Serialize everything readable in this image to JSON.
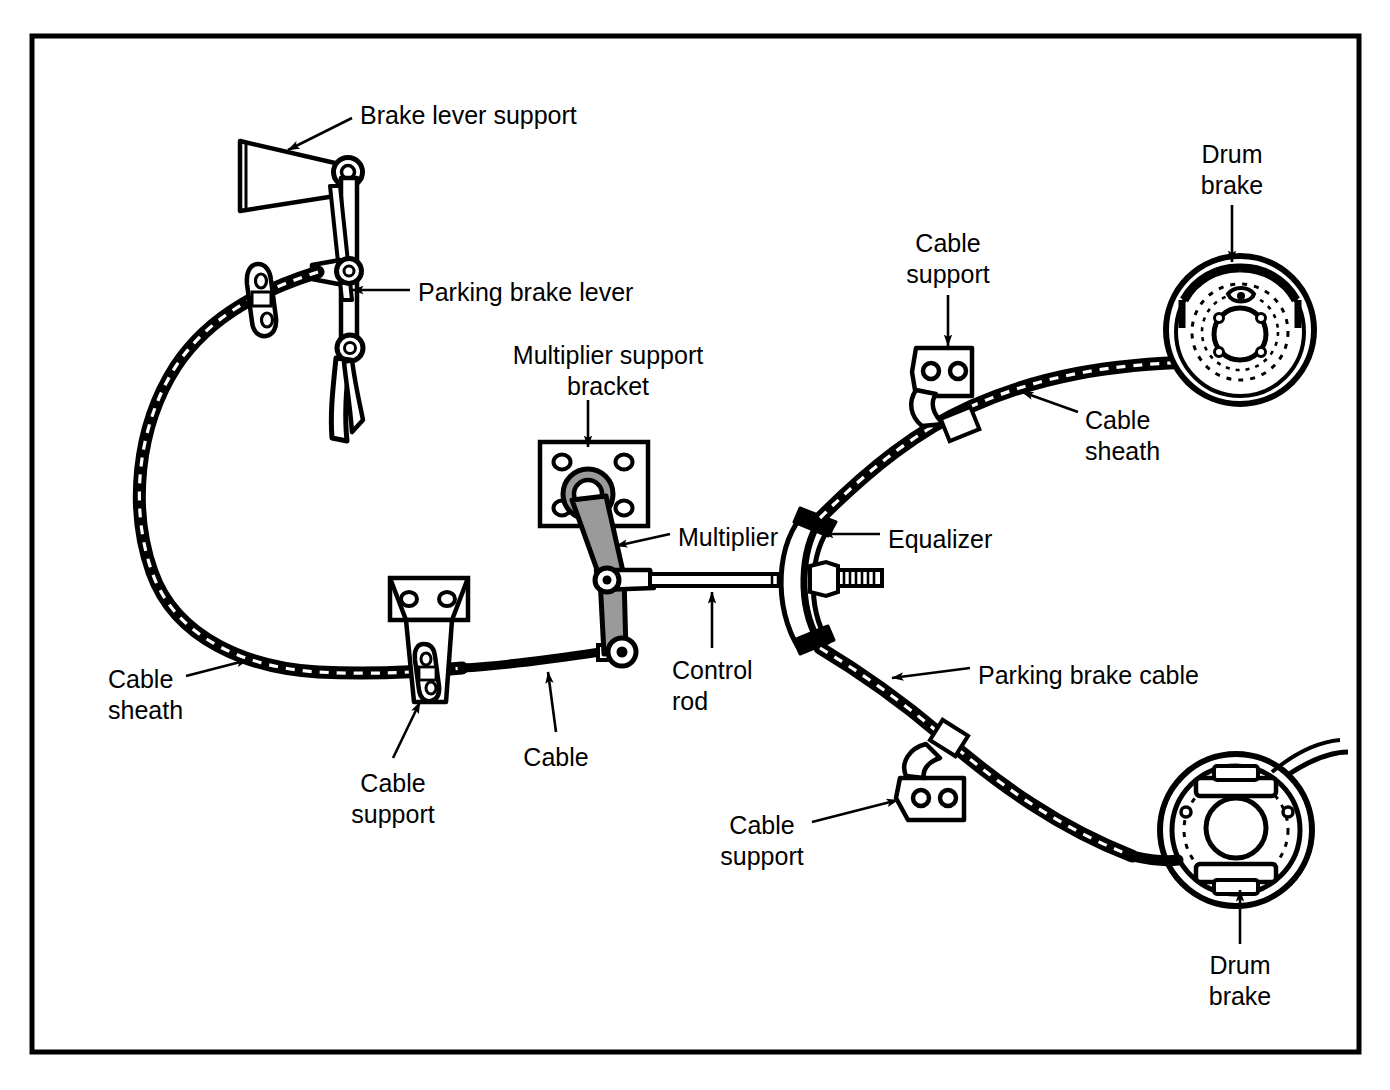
{
  "figure": {
    "type": "technical-line-illustration",
    "frame": {
      "x": 30,
      "y": 34,
      "width": 1330,
      "height": 1019,
      "stroke": "#000000",
      "stroke_width": 5
    },
    "background": "#ffffff",
    "line_color": "#000000",
    "fill_gray": "#9a9a9a"
  },
  "labels": [
    {
      "id": "brake-lever-support",
      "text": "Brake lever support",
      "x": 360,
      "y": 100,
      "align": "l",
      "leader": {
        "from": [
          352,
          118
        ],
        "to": [
          288,
          150
        ],
        "arrow": true
      }
    },
    {
      "id": "parking-brake-lever",
      "text": "Parking brake lever",
      "x": 418,
      "y": 277,
      "align": "l",
      "leader": {
        "from": [
          410,
          290
        ],
        "to": [
          352,
          290
        ],
        "arrow": true
      }
    },
    {
      "id": "drum-brake-upper",
      "text": "Drum\nbrake",
      "x": 1232,
      "y": 139,
      "align": "c",
      "leader": {
        "from": [
          1232,
          205
        ],
        "to": [
          1232,
          262
        ],
        "arrow": true
      }
    },
    {
      "id": "cable-support-upper-right",
      "text": "Cable\nsupport",
      "x": 948,
      "y": 228,
      "align": "c",
      "leader": {
        "from": [
          948,
          295
        ],
        "to": [
          948,
          346
        ],
        "arrow": true
      }
    },
    {
      "id": "cable-sheath-right",
      "text": "Cable\nsheath",
      "x": 1085,
      "y": 405,
      "align": "l",
      "leader": {
        "from": [
          1078,
          412
        ],
        "to": [
          1022,
          392
        ],
        "arrow": true
      }
    },
    {
      "id": "multiplier-support-bracket",
      "text": "Multiplier support\nbracket",
      "x": 608,
      "y": 340,
      "align": "c",
      "leader": {
        "from": [
          588,
          400
        ],
        "to": [
          588,
          447
        ],
        "arrow": true
      }
    },
    {
      "id": "multiplier",
      "text": "Multiplier",
      "x": 678,
      "y": 522,
      "align": "l",
      "leader": {
        "from": [
          670,
          534
        ],
        "to": [
          616,
          546
        ],
        "arrow": true
      }
    },
    {
      "id": "equalizer",
      "text": "Equalizer",
      "x": 888,
      "y": 524,
      "align": "l",
      "leader": {
        "from": [
          880,
          534
        ],
        "to": [
          822,
          534
        ],
        "arrow": true
      }
    },
    {
      "id": "parking-brake-cable",
      "text": "Parking brake cable",
      "x": 978,
      "y": 660,
      "align": "l",
      "leader": {
        "from": [
          970,
          668
        ],
        "to": [
          892,
          678
        ],
        "arrow": true
      }
    },
    {
      "id": "control-rod",
      "text": "Control\nrod",
      "x": 672,
      "y": 655,
      "align": "l",
      "leader": {
        "from": [
          712,
          648
        ],
        "to": [
          712,
          592
        ],
        "arrow": true
      }
    },
    {
      "id": "cable-sheath-left",
      "text": "Cable\nsheath",
      "x": 108,
      "y": 664,
      "align": "l",
      "leader": {
        "from": [
          186,
          676
        ],
        "to": [
          248,
          660
        ],
        "arrow": true
      }
    },
    {
      "id": "cable-support-left",
      "text": "Cable\nsupport",
      "x": 393,
      "y": 768,
      "align": "c",
      "leader": {
        "from": [
          393,
          758
        ],
        "to": [
          420,
          702
        ],
        "arrow": true
      }
    },
    {
      "id": "cable",
      "text": "Cable",
      "x": 556,
      "y": 742,
      "align": "c",
      "leader": {
        "from": [
          556,
          732
        ],
        "to": [
          548,
          672
        ],
        "arrow": true
      }
    },
    {
      "id": "cable-support-lower-right",
      "text": "Cable\nsupport",
      "x": 762,
      "y": 810,
      "align": "c",
      "leader": {
        "from": [
          812,
          822
        ],
        "to": [
          898,
          800
        ],
        "arrow": true
      }
    },
    {
      "id": "drum-brake-lower",
      "text": "Drum\nbrake",
      "x": 1240,
      "y": 950,
      "align": "c",
      "leader": {
        "from": [
          1240,
          944
        ],
        "to": [
          1240,
          890
        ],
        "arrow": true
      }
    }
  ],
  "components": [
    {
      "id": "brake-lever-support",
      "name": "Brake lever support"
    },
    {
      "id": "parking-brake-lever",
      "name": "Parking brake lever"
    },
    {
      "id": "multiplier-support-bracket",
      "name": "Multiplier support bracket"
    },
    {
      "id": "multiplier",
      "name": "Multiplier"
    },
    {
      "id": "control-rod",
      "name": "Control rod"
    },
    {
      "id": "equalizer",
      "name": "Equalizer"
    },
    {
      "id": "cable-sheath-left",
      "name": "Cable sheath"
    },
    {
      "id": "cable-sheath-right",
      "name": "Cable sheath"
    },
    {
      "id": "parking-brake-cable",
      "name": "Parking brake cable"
    },
    {
      "id": "cable",
      "name": "Cable"
    },
    {
      "id": "cable-support-left",
      "name": "Cable support"
    },
    {
      "id": "cable-support-upper-right",
      "name": "Cable support"
    },
    {
      "id": "cable-support-lower-right",
      "name": "Cable support"
    },
    {
      "id": "drum-brake-upper",
      "name": "Drum brake"
    },
    {
      "id": "drum-brake-lower",
      "name": "Drum brake"
    }
  ]
}
